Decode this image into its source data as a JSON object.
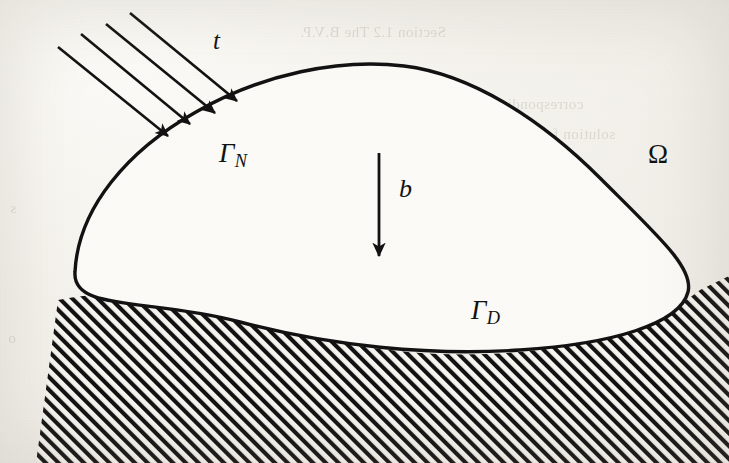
{
  "figure": {
    "kind": "continuum-domain-diagram",
    "background_color": "#f6f4ef",
    "ink_color": "#101010",
    "labels": {
      "traction": "t",
      "neumann_boundary_gamma": "Γ",
      "neumann_boundary_sub": "N",
      "dirichlet_boundary_gamma": "Γ",
      "dirichlet_boundary_sub": "D",
      "body_force": "b",
      "domain": "Ω"
    },
    "arrows": {
      "traction_count": 4,
      "traction_direction": "down-right",
      "body_force_direction": "down"
    },
    "hatching": {
      "angle_deg": 45,
      "description": "diagonal support hatching below the body"
    }
  },
  "showthrough": {
    "note": "faint mirrored text bleeding through the scanned page",
    "lines": [
      {
        "text": "Section 1.2  The  B.V.P.",
        "x": 300,
        "y": 24,
        "size": 15
      },
      {
        "text": "corresponding  to  the  elastic",
        "x": 404,
        "y": 96,
        "size": 15
      },
      {
        "text": "solution  for  a  given  domain  Ω",
        "x": 420,
        "y": 126,
        "size": 15
      },
      {
        "text": "1.2.3   The  Variational  Form",
        "x": 360,
        "y": 182,
        "size": 15
      },
      {
        "text": "Multiplying  the  equilibrium  equation",
        "x": 300,
        "y": 264,
        "size": 15
      },
      {
        "text": "arbitrary  test  function  and  integrating",
        "x": 300,
        "y": 292,
        "size": 15
      },
      {
        "text": "the  natural  boundary  conditions",
        "x": 300,
        "y": 320,
        "size": 15
      },
      {
        "text": "we  arrive  at  the  weak  form",
        "x": 300,
        "y": 348,
        "size": 15
      },
      {
        "text": "and  thus  the  displacement  u  solves",
        "x": 260,
        "y": 424,
        "size": 15
      },
      {
        "text": "s",
        "x": 10,
        "y": 200,
        "size": 15
      },
      {
        "text": "o",
        "x": 8,
        "y": 330,
        "size": 15
      }
    ]
  }
}
